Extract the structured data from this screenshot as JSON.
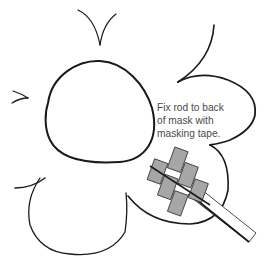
{
  "illustration": {
    "subject": "mask-outline-with-rod-taped-to-back",
    "caption": {
      "lines": [
        "Fix rod to back",
        "of mask with",
        "masking tape."
      ]
    },
    "colors": {
      "background": "#ffffff",
      "line": "#1a1a1a",
      "tape_fill": "#9a9a9a",
      "text": "#4a4a4a"
    }
  }
}
